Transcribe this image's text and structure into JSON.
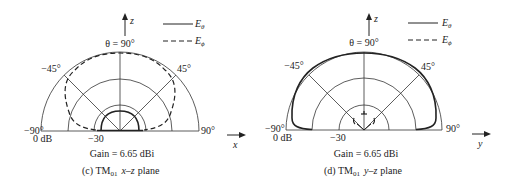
{
  "figure": {
    "panels": [
      {
        "id": "c",
        "center": [
          120,
          131
        ],
        "outer_radius": 79,
        "ring_radii": [
          79,
          52,
          26
        ],
        "axis_up_label": "z",
        "axis_side_label": "x",
        "top_label": "θ = 90°",
        "left_angle_label": "−45°",
        "right_angle_label": "45°",
        "left_end_label": "−90°",
        "right_end_label": "90°",
        "zero_db_label": "0 dB",
        "minus30_label": "−30",
        "gain_label": "Gain = 6.65 dBi",
        "caption_prefix": "(c) TM",
        "caption_sub": "01",
        "caption_plane": "x–z",
        "caption_suffix": "plane",
        "legend": {
          "solid_label": "E",
          "solid_sub": "θ",
          "dash_label": "E",
          "dash_sub": "ϕ"
        },
        "e_theta_desc": "small lobe, radius ~20 (about -33 dB)",
        "e_phi_desc": "broad lobe near outer ring, dips toward horizon"
      },
      {
        "id": "d",
        "center": [
          364,
          130
        ],
        "outer_radius": 78,
        "ring_radii": [
          78,
          52,
          25
        ],
        "axis_up_label": "z",
        "axis_side_label": "y",
        "top_label": "θ = 90°",
        "left_angle_label": "−45°",
        "right_angle_label": "45°",
        "left_end_label": "−90°",
        "right_end_label": "90°",
        "zero_db_label": "0 dB",
        "minus30_label": "−30",
        "gain_label": "Gain = 6.65 dBi",
        "caption_prefix": "(d) TM",
        "caption_sub": "01",
        "caption_plane": "y–z",
        "caption_suffix": "plane",
        "legend": {
          "solid_label": "E",
          "solid_sub": "θ",
          "dash_label": "E",
          "dash_sub": "ϕ"
        },
        "e_theta_desc": "broad lobe close to outer ring",
        "e_phi_desc": "tiny fragments near center"
      }
    ]
  }
}
